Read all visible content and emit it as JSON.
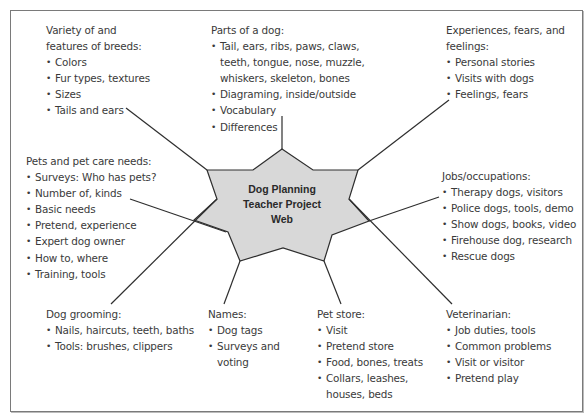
{
  "diagram": {
    "center": {
      "lines": [
        "Dog Planning",
        "Teacher Project",
        "Web"
      ],
      "fill": "#d8d8d8"
    },
    "nodes": [
      {
        "id": "breeds",
        "title": [
          "Variety of and",
          "features of breeds:"
        ],
        "items": [
          "Colors",
          "Fur types, textures",
          "Sizes",
          "Tails and ears"
        ]
      },
      {
        "id": "parts",
        "title": [
          "Parts of a dog:"
        ],
        "items": [
          "Tail, ears, ribs, paws, claws,\nteeth, tongue, nose, muzzle,\nwhiskers, skeleton, bones",
          "Diagraming, inside/outside",
          "Vocabulary",
          "Differences"
        ]
      },
      {
        "id": "experiences",
        "title": [
          "Experiences, fears, and",
          "feelings:"
        ],
        "items": [
          "Personal stories",
          "Visits with dogs",
          "Feelings, fears"
        ]
      },
      {
        "id": "pets",
        "title": [
          "Pets and pet care needs:"
        ],
        "items": [
          "Surveys: Who has pets?",
          "Number of, kinds",
          "Basic needs",
          "Pretend, experience",
          "Expert dog owner",
          "How to, where",
          "Training, tools"
        ]
      },
      {
        "id": "jobs",
        "title": [
          "Jobs/occupations:"
        ],
        "items": [
          "Therapy dogs, visitors",
          "Police dogs, tools, demo",
          "Show dogs, books, video",
          "Firehouse dog, research",
          "Rescue dogs"
        ]
      },
      {
        "id": "grooming",
        "title": [
          "Dog grooming:"
        ],
        "items": [
          "Nails, haircuts, teeth, baths",
          "Tools: brushes, clippers"
        ]
      },
      {
        "id": "names",
        "title": [
          "Names:"
        ],
        "items": [
          "Dog tags",
          "Surveys and\nvoting"
        ]
      },
      {
        "id": "petstore",
        "title": [
          "Pet store:"
        ],
        "items": [
          "Visit",
          "Pretend store",
          "Food, bones, treats",
          "Collars, leashes,\nhouses, beds"
        ]
      },
      {
        "id": "vet",
        "title": [
          "Veterinarian:"
        ],
        "items": [
          "Job duties, tools",
          "Common problems",
          "Visit or visitor",
          "Pretend play"
        ]
      }
    ]
  }
}
